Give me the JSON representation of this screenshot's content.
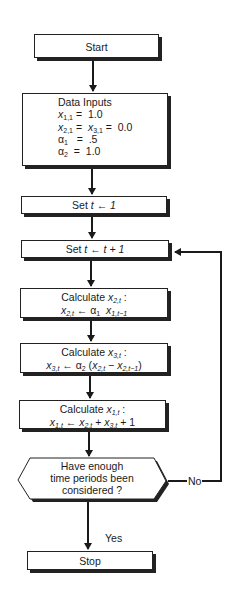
{
  "nodes": {
    "start": {
      "label": "Start"
    },
    "data_inputs": {
      "title": "Data Inputs",
      "lines": [
        {
          "lhs": "x",
          "lhs_sub": "1,1",
          "rhs": "1.0"
        },
        {
          "lhs": "x",
          "lhs_sub": "2,1",
          "mid": "x",
          "mid_sub": "3,1",
          "rhs": "0.0"
        },
        {
          "lhs": "α",
          "lhs_sub": "1",
          "rhs": ".5"
        },
        {
          "lhs": "α",
          "lhs_sub": "2",
          "rhs": "1.0"
        }
      ]
    },
    "set_t1": {
      "prefix": "Set ",
      "expr": "t ← 1"
    },
    "set_tinc": {
      "prefix": "Set ",
      "expr": "t ← t + 1"
    },
    "calc_x2": {
      "title": "Calculate ",
      "var": "x",
      "var_sub": "2,t",
      "colon": " :"
    },
    "calc_x3": {
      "title": "Calculate ",
      "var": "x",
      "var_sub": "3,t",
      "colon": " :"
    },
    "calc_x1": {
      "title": "Calculate ",
      "var": "x",
      "var_sub": "1,t",
      "colon": " :"
    },
    "decision": {
      "lines": [
        "Have enough",
        "time periods been",
        "considered ?"
      ]
    },
    "stop": {
      "label": "Stop"
    }
  },
  "edges": {
    "yes_label": "Yes",
    "no_label": "No"
  },
  "formulas": {
    "x2": {
      "a": "x",
      "a_sub": "2,t",
      "op": " ← ",
      "b": "α",
      "b_sub": "1",
      "c": "x",
      "c_sub": "1,t−1"
    },
    "x3": {
      "a": "x",
      "a_sub": "3,t",
      "op": " ← ",
      "b": "α",
      "b_sub": "2",
      "open": " (",
      "c": "x",
      "c_sub": "2,t",
      "minus": " − ",
      "d": "x",
      "d_sub": "2,t−1",
      "close": ")"
    },
    "x1": {
      "a": "x",
      "a_sub": "1,t",
      "op": " ← ",
      "b": "x",
      "b_sub": "2,t",
      "plus": " + ",
      "c": "x",
      "c_sub": "3,t",
      "plus2": " + ",
      "d": "1"
    }
  }
}
